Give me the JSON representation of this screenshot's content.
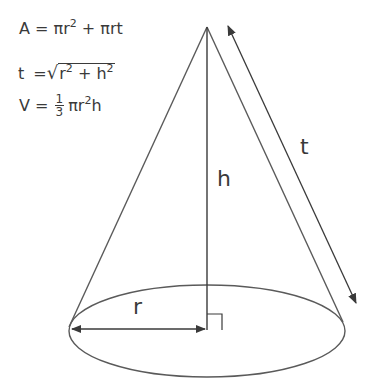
{
  "formulas": {
    "area": {
      "lhs": "A",
      "eq": " = ",
      "term1": "πr",
      "term1_exp": "2",
      "plus": " + ",
      "term2": "πrt"
    },
    "slant": {
      "lhs": "t",
      "eq": " =",
      "radical": "√",
      "a": "r",
      "a_exp": "2",
      "plus": " + ",
      "b": "h",
      "b_exp": "2"
    },
    "volume": {
      "lhs": "V",
      "eq": " = ",
      "frac_num": "1",
      "frac_den": "3",
      "term": "πr",
      "term_exp": "2",
      "term_tail": "h"
    }
  },
  "labels": {
    "height": "h",
    "radius": "r",
    "slant": "t"
  },
  "colors": {
    "stroke": "#4a4a4a",
    "text": "#3a3a3a",
    "background": "#ffffff"
  }
}
